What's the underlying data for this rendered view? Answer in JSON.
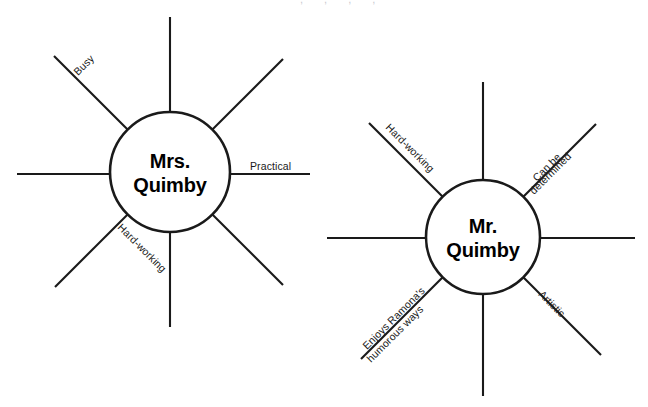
{
  "page": {
    "background_color": "#ffffff",
    "line_color": "#1a1a1a",
    "text_color": "#000000",
    "width": 648,
    "height": 407
  },
  "diagrams": [
    {
      "id": "mrs-quimby-web",
      "name": "Mrs. Quimby character web",
      "hub": {
        "line1": "Mrs.",
        "line2": "Quimby",
        "center_x": 170,
        "center_y": 172,
        "radius": 60
      },
      "spoke_count": 8,
      "labels": [
        {
          "id": "busy",
          "text": "Busy",
          "position": "upper-left-diagonal",
          "angle_deg": -45
        },
        {
          "id": "practical",
          "text": "Practical",
          "position": "right-horizontal",
          "angle_deg": 0
        },
        {
          "id": "hard-working",
          "text": "Hard-working",
          "position": "lower-left-diagonal",
          "angle_deg": 45
        }
      ]
    },
    {
      "id": "mr-quimby-web",
      "name": "Mr. Quimby character web",
      "hub": {
        "line1": "Mr.",
        "line2": "Quimby",
        "center_x": 483,
        "center_y": 237,
        "radius": 57
      },
      "spoke_count": 8,
      "labels": [
        {
          "id": "hard-working",
          "text": "Hard-working",
          "position": "upper-left-diagonal",
          "angle_deg": -45
        },
        {
          "id": "can-be-determined-line1",
          "text": "Can be",
          "position": "upper-right-diagonal-above",
          "angle_deg": 45
        },
        {
          "id": "can-be-determined-line2",
          "text": "determined",
          "position": "upper-right-diagonal-below",
          "angle_deg": 45
        },
        {
          "id": "enjoys-humor-line1",
          "text": "Enjoys Ramona's",
          "position": "lower-left-diagonal-above",
          "angle_deg": 45
        },
        {
          "id": "enjoys-humor-line2",
          "text": "humorous ways",
          "position": "lower-left-diagonal-below",
          "angle_deg": 45
        },
        {
          "id": "artistic",
          "text": "Artistic",
          "position": "lower-right-diagonal",
          "angle_deg": -45
        }
      ]
    }
  ],
  "artifact": {
    "clipped_top_text": ", , , ,"
  }
}
